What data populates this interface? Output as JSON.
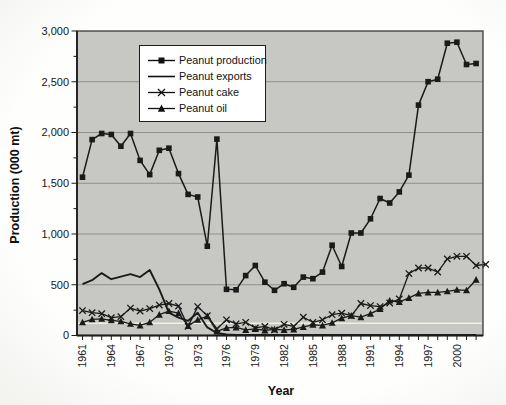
{
  "axis_titles": {
    "y": "Production (000 mt)",
    "x": "Year"
  },
  "legend": {
    "items": [
      "Peanut production",
      "Peanut exports",
      "Peanut cake",
      "Peanut oil"
    ]
  },
  "chart_data": {
    "type": "line",
    "title": "",
    "xlabel": "Year",
    "ylabel": "Production (000 mt)",
    "x_start": 1961,
    "x_end": 2002,
    "x_tick_label_years": [
      1961,
      1964,
      1967,
      1970,
      1973,
      1976,
      1979,
      1982,
      1985,
      1988,
      1991,
      1994,
      1997,
      2000
    ],
    "y_ticks": [
      0,
      500,
      1000,
      1500,
      2000,
      2500,
      3000
    ],
    "y_tick_labels": [
      "0",
      "500",
      "1,000",
      "1,500",
      "2,000",
      "2,500",
      "3,000"
    ],
    "ylim": [
      0,
      3000
    ],
    "grid": "horizontal-major",
    "y_minor_tick_step": 250,
    "legend_position": "top-left-inside",
    "colors": {
      "plot_bg": "#c7c7c3",
      "gridline": "#8f8f8c",
      "frame": "#3a3a38",
      "line": "#1a1a1a",
      "scan_artifact_line": "#f4f0d8",
      "tick_text": "#161616"
    },
    "scan_artifact_line_value": 120,
    "series": [
      {
        "name": "Peanut production",
        "marker": "square",
        "line_width": 1.5,
        "values": [
          1560,
          1930,
          1990,
          1980,
          1865,
          1990,
          1725,
          1585,
          1825,
          1845,
          1595,
          1390,
          1365,
          880,
          1935,
          455,
          450,
          590,
          690,
          525,
          445,
          510,
          475,
          575,
          560,
          625,
          890,
          680,
          1010,
          1010,
          1150,
          1350,
          1305,
          1415,
          1580,
          2270,
          2500,
          2525,
          2880,
          2890,
          2670,
          2680
        ]
      },
      {
        "name": "Peanut exports",
        "marker": "none",
        "line_width": 1.9,
        "values": [
          505,
          545,
          615,
          555,
          580,
          605,
          575,
          645,
          455,
          225,
          175,
          145,
          225,
          80,
          25,
          10,
          5,
          5,
          5,
          5,
          5,
          5,
          5,
          5,
          5,
          5,
          5,
          5,
          5,
          5,
          5,
          5,
          5,
          5,
          5,
          5,
          5,
          5,
          5,
          5,
          5,
          5
        ]
      },
      {
        "name": "Peanut cake",
        "marker": "x",
        "line_width": 1.3,
        "values": [
          245,
          225,
          215,
          175,
          185,
          270,
          240,
          265,
          300,
          315,
          290,
          90,
          285,
          195,
          65,
          155,
          115,
          130,
          75,
          90,
          55,
          110,
          90,
          180,
          130,
          155,
          205,
          220,
          195,
          315,
          295,
          285,
          320,
          360,
          610,
          665,
          665,
          625,
          755,
          780,
          780,
          690,
          700
        ]
      },
      {
        "name": "Peanut oil",
        "marker": "triangle",
        "line_width": 1.3,
        "values": [
          130,
          160,
          165,
          150,
          140,
          115,
          100,
          130,
          205,
          240,
          220,
          95,
          155,
          190,
          40,
          75,
          80,
          55,
          65,
          50,
          60,
          55,
          60,
          85,
          105,
          100,
          125,
          170,
          195,
          180,
          215,
          260,
          345,
          330,
          370,
          415,
          425,
          425,
          435,
          450,
          445,
          550
        ]
      }
    ]
  }
}
